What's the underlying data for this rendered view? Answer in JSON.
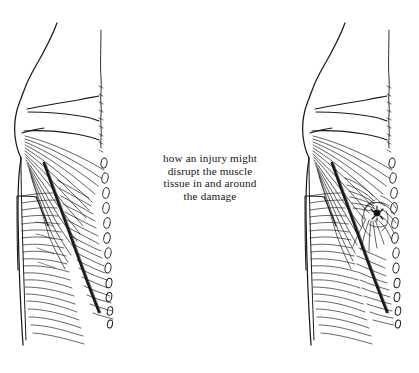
{
  "illustration": {
    "title": "anatomical line drawing of back muscles, two panels",
    "background_color": "#ffffff",
    "ink_color": "#1a1a1a",
    "panels": [
      {
        "id": "left-panel",
        "name": "uninjured-back",
        "description": "lateral view of torso showing back muscle fibers running in regular parallel bands",
        "injury_marked": "no"
      },
      {
        "id": "right-panel",
        "name": "injured-back",
        "description": "lateral view of torso with a dark injury knot; muscle fibers are pulled and swirl around the damage",
        "injury_marked": "yes",
        "injury_point": {
          "x": 377,
          "y": 214
        }
      }
    ],
    "spine_label": "spinous processes column",
    "fiber_label": "muscle fiber striations"
  },
  "caption": {
    "lines": [
      "how an injury might",
      "disrupt the muscle",
      "tissue in and around",
      "the damage"
    ],
    "line1": "how an injury might",
    "line2": "disrupt the muscle",
    "line3": "tissue in and around",
    "line4": "the damage"
  }
}
